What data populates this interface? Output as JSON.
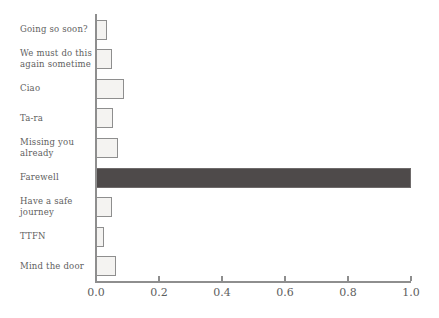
{
  "chart_data": {
    "type": "bar",
    "orientation": "horizontal",
    "title": "",
    "xlabel": "",
    "ylabel": "",
    "grid": false,
    "legend": "none",
    "xlim": [
      0,
      1.0
    ],
    "x_ticks": [
      "0.0",
      "0.2",
      "0.4",
      "0.6",
      "0.8",
      "1.0"
    ],
    "x_tick_values": [
      0,
      0.2,
      0.4,
      0.6,
      0.8,
      1.0
    ],
    "categories": [
      "Going so soon?",
      "We must do this again sometime",
      "Ciao",
      "Ta-ra",
      "Missing you already",
      "Farewell",
      "Have a safe journey",
      "TTFN",
      "Mind the door"
    ],
    "values": [
      0.035,
      0.05,
      0.09,
      0.055,
      0.07,
      1.0,
      0.05,
      0.025,
      0.065
    ],
    "highlight_category": "Farewell"
  },
  "colors": {
    "background": "#ffffff",
    "bar_fill": "#f4f3f1",
    "bar_border": "#8e8e8e",
    "highlight_fill": "#4e4a4a",
    "axis": "#8e8e8e",
    "text": "#5e5e5e"
  }
}
